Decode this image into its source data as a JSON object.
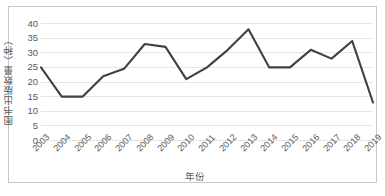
{
  "chart_data": {
    "type": "line",
    "title": "",
    "xlabel": "年份",
    "ylabel": "图书出版数量（种）",
    "categories": [
      "2003",
      "2004",
      "2005",
      "2006",
      "2007",
      "2008",
      "2009",
      "2010",
      "2011",
      "2012",
      "2013",
      "2014",
      "2015",
      "2016",
      "2017",
      "2018",
      "2019"
    ],
    "values": [
      25,
      15,
      15,
      22,
      24.5,
      33,
      32,
      21,
      25,
      31,
      38,
      25,
      25,
      31,
      28,
      34,
      13
    ],
    "series": [
      {
        "name": "图书出版数量",
        "values": [
          25,
          15,
          15,
          22,
          24.5,
          33,
          32,
          21,
          25,
          31,
          38,
          25,
          25,
          31,
          28,
          34,
          13
        ],
        "color": "#404040"
      }
    ],
    "ylim": [
      0,
      40
    ],
    "yticks": [
      "0",
      "5",
      "10",
      "15",
      "20",
      "25",
      "30",
      "35",
      "40"
    ],
    "ytick_values": [
      0,
      5,
      10,
      15,
      20,
      25,
      30,
      35,
      40
    ],
    "grid": true,
    "grid_axis": "y",
    "legend": false,
    "legend_position": "none",
    "colors": {
      "line": "#404040",
      "grid": "#e2e2e2",
      "border": "#c9c9c9",
      "text": "#5a5a5a",
      "background": "#ffffff"
    }
  }
}
